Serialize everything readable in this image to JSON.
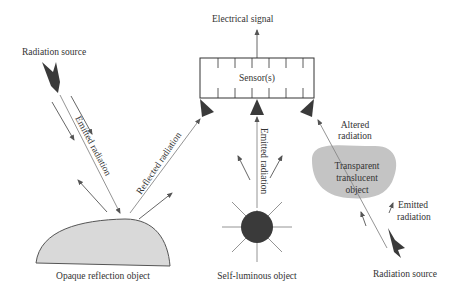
{
  "diagram": {
    "type": "sensing-scheme",
    "sensor": {
      "label": "Sensor(s)",
      "output": "Electrical signal"
    },
    "left_branch": {
      "source_label": "Radiation source",
      "emitted_label": "Emitted radiation",
      "reflected_label": "Reflected radiation",
      "object_label": "Opaque reflection object"
    },
    "middle_branch": {
      "emitted_label": "Emitted radiation",
      "object_label": "Self-luminous object"
    },
    "right_branch": {
      "altered_label_line1": "Altered",
      "altered_label_line2": "radiation",
      "object_label_line1": "Transparent",
      "object_label_line2": "translucent",
      "object_label_line3": "object",
      "emitted_label_line1": "Emitted",
      "emitted_label_line2": "radiation",
      "source_label": "Radiation source"
    },
    "colors": {
      "object_fill": "#d9d9d9",
      "blob_fill": "#c4c4c4",
      "dark": "#3a3a3a",
      "line": "#888888"
    }
  }
}
